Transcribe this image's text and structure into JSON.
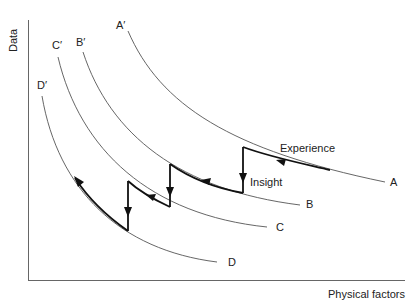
{
  "axes": {
    "y_label": "Data",
    "x_label": "Physical factors"
  },
  "curves": [
    {
      "start_label": "A′",
      "end_label": "A"
    },
    {
      "start_label": "B′",
      "end_label": "B"
    },
    {
      "start_label": "C′",
      "end_label": "C"
    },
    {
      "start_label": "D′",
      "end_label": "D"
    }
  ],
  "annotations": {
    "experience": "Experience",
    "insight": "Insight"
  },
  "colors": {
    "thin_curve": "#555555",
    "thick_path": "#111111",
    "axis": "#555555",
    "text": "#222222"
  }
}
